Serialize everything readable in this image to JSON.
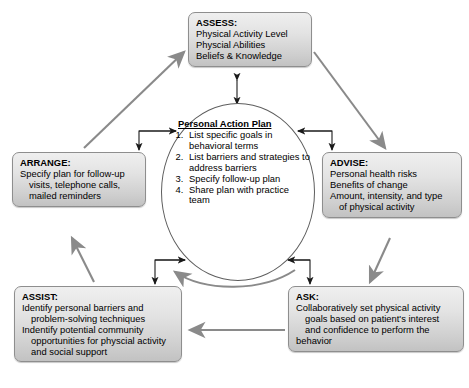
{
  "diagram": {
    "colors": {
      "box_fill": "#e0e0e0",
      "box_border": "#8e8e8e",
      "outer_arrow": "#8a8a8a",
      "inner_arrow": "#1a1a1a",
      "circle_border": "#5d5d5d"
    }
  },
  "assess": {
    "title": "ASSESS:",
    "lines": [
      "Physical Activity Level",
      "Physcial Abilities",
      "Beliefs & Knowledge"
    ]
  },
  "advise": {
    "title": "ADVISE:",
    "lines": [
      "Personal health risks",
      "Benefits of change",
      "Amount, intensity, and type",
      "of physical activity"
    ]
  },
  "ask": {
    "title": "ASK:",
    "lines": [
      "Collaboratively set physical activity",
      "goals based on patient's interest",
      "and confidence to perform the",
      "behavior"
    ]
  },
  "assist": {
    "title": "ASSIST:",
    "lines": [
      "Identify personal barriers and",
      "problem-solving techniques",
      "Indentify potential community",
      "opportunities for physcial activity",
      "and social support"
    ]
  },
  "arrange": {
    "title": "ARRANGE:",
    "lines": [
      "Specify plan for follow-up",
      "visits, telephone calls,",
      "mailed reminders"
    ]
  },
  "center": {
    "title": "Personal Action Plan",
    "items": [
      "List specific goals in behavioral terms",
      "List barriers and strategies to address barriers",
      "Specify follow-up plan",
      "Share plan with practice team"
    ]
  }
}
